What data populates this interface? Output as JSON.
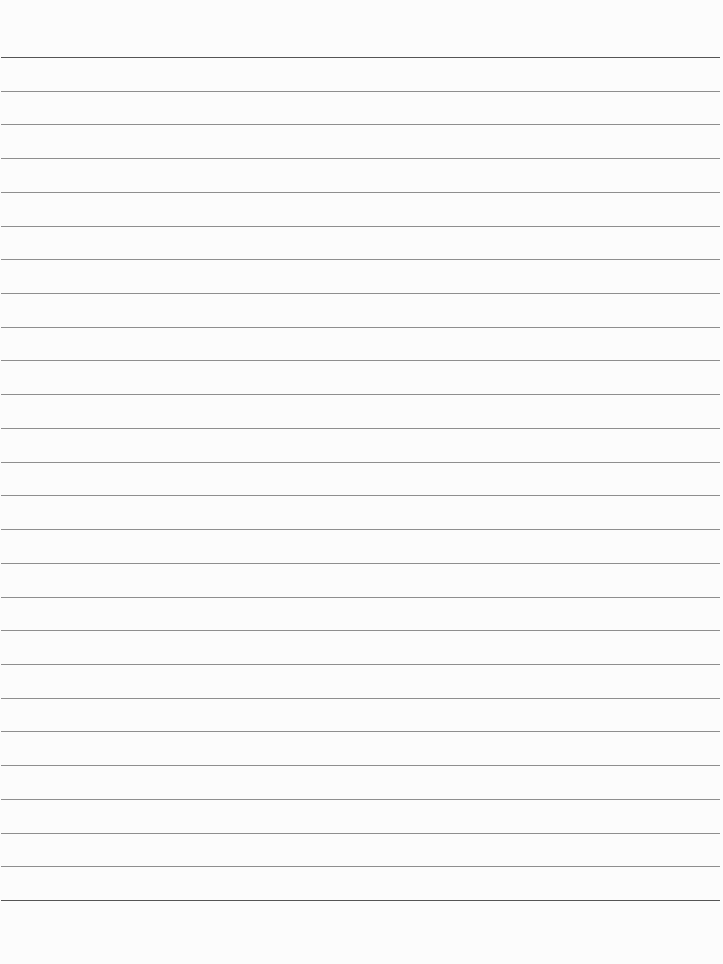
{
  "page": {
    "type": "lined-paper",
    "background_color": "#fcfcfc",
    "line_color": "#8e8e8e",
    "border_line_color": "#555555",
    "line_count": 26,
    "first_line_y": 57,
    "line_spacing": 33.72
  }
}
